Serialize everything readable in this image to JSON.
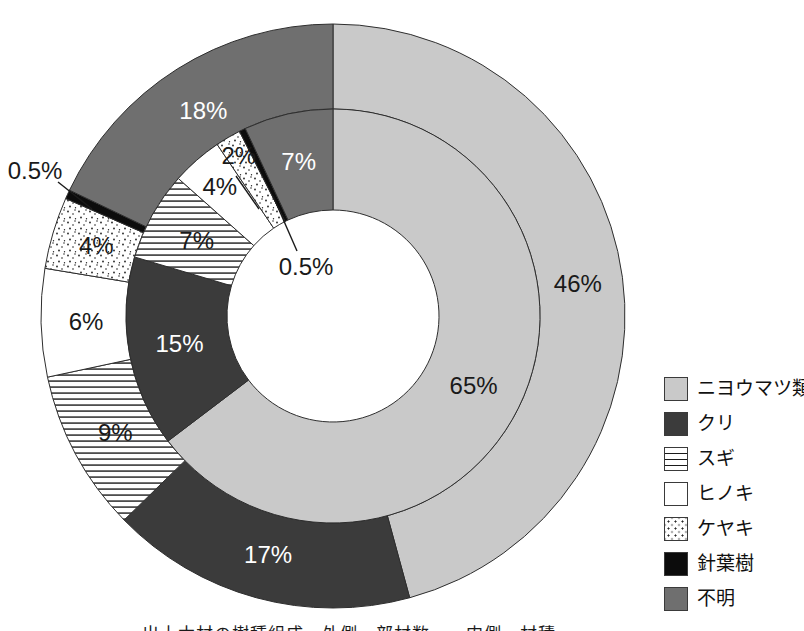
{
  "figure": {
    "background_color": "#ffffff",
    "caption": "出土木材の樹種組成　外側・部材数　　内側・材積"
  },
  "chart_data": {
    "type": "pie",
    "subtype": "nested-donut-two-rings",
    "title": "",
    "legend_position": "right",
    "legend": [
      {
        "label": "ニヨウマツ類",
        "fill": "lightgray",
        "color": "#c9c9c9"
      },
      {
        "label": "クリ",
        "fill": "charcoal",
        "color": "#3b3b3b"
      },
      {
        "label": "スギ",
        "fill": "lines",
        "color": "#ffffff"
      },
      {
        "label": "ヒノキ",
        "fill": "white",
        "color": "#ffffff"
      },
      {
        "label": "ケヤキ",
        "fill": "dots",
        "color": "#ffffff"
      },
      {
        "label": "針葉樹",
        "fill": "black",
        "color": "#0c0c0c"
      },
      {
        "label": "不明",
        "fill": "gray",
        "color": "#6f6f6f"
      }
    ],
    "series": [
      {
        "name": "outer-ring",
        "values": [
          46,
          17,
          9,
          6,
          4,
          0.5,
          18
        ],
        "labels": [
          "46%",
          "17%",
          "9%",
          "6%",
          "4%",
          "0.5%",
          "18%"
        ]
      },
      {
        "name": "inner-ring",
        "values": [
          65,
          15,
          7,
          4,
          2,
          0.5,
          7
        ],
        "labels": [
          "65%",
          "15%",
          "7%",
          "4%",
          "2%",
          "0.5%",
          "7%"
        ]
      }
    ],
    "annotations": {
      "outer_half_percent_label": "0.5%",
      "inner_half_percent_label": "0.5%"
    },
    "colors": {
      "outline": "#2e2e2e",
      "label_dark": "#1a1a1a",
      "label_light": "#ffffff"
    }
  }
}
